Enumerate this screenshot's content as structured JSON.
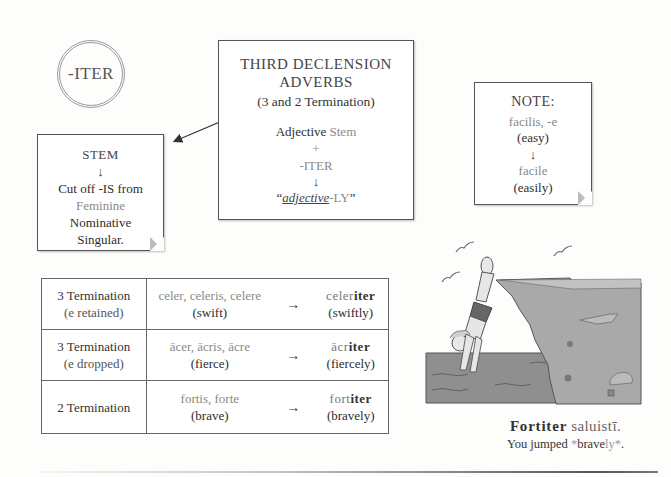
{
  "circle": {
    "label": "-ITER"
  },
  "main_box": {
    "title_line1": "THIRD DECLENSION",
    "title_line2": "ADVERBS",
    "subtitle": "(3 and 2 Termination)",
    "formula": {
      "part1_a": "Adjective",
      "part1_b": " Stem",
      "plus": "+",
      "suffix": "-ITER",
      "arrow": "↓",
      "result_open": "“",
      "result_italic": "adjective",
      "result_rest": "-LY",
      "result_close": "”"
    }
  },
  "stem_box": {
    "title": "STEM",
    "arrow": "↓",
    "line1": "Cut off -IS from",
    "line2": "Feminine",
    "line3": "Nominative",
    "line4": "Singular."
  },
  "note_box": {
    "title": "NOTE:",
    "line1": "facilis, -e",
    "line2": "(easy)",
    "arrow": "↓",
    "line3": "facile",
    "line4": "(easily)"
  },
  "table": {
    "rows": [
      {
        "type_line1": "3 Termination",
        "type_line2": "(e retained)",
        "forms": "celer, celeris, celere",
        "meaning": "(swift)",
        "arrow": "→",
        "adverb_stem": "celer",
        "adverb_end": "iter",
        "adverb_meaning": "(swiftly)"
      },
      {
        "type_line1": "3 Termination",
        "type_line2": "(e dropped)",
        "forms": "ācer, ācris, ācre",
        "meaning": "(fierce)",
        "arrow": "→",
        "adverb_stem": "ācr",
        "adverb_end": "iter",
        "adverb_meaning": "(fiercely)"
      },
      {
        "type_line1": "2 Termination",
        "type_line2": "",
        "forms": "fortis, forte",
        "meaning": "(brave)",
        "arrow": "→",
        "adverb_stem": "fort",
        "adverb_end": "iter",
        "adverb_meaning": "(bravely)"
      }
    ]
  },
  "illustration": {
    "subject": "boy diving off a cliff into water",
    "icon": "diver-illustration"
  },
  "caption": {
    "latin_bold": "Fortiter",
    "latin_rest": " saluistī.",
    "english_a": "You jumped ",
    "english_star1": "*",
    "english_b": "brave",
    "english_c": "ly",
    "english_star2": "*",
    "english_end": "."
  },
  "colors": {
    "text": "#333333",
    "muted": "#8a8a8a",
    "water": "#8f8f8f",
    "cliff": "#a9a9a9"
  }
}
